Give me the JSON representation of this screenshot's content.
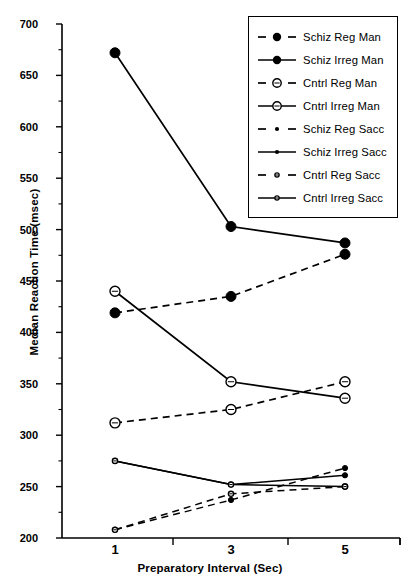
{
  "chart_data": {
    "type": "line",
    "title": "",
    "xlabel": "Preparatory Interval (Sec)",
    "ylabel": "Median Reaction Time (msec)",
    "x": [
      1,
      3,
      5
    ],
    "xticklabels": [
      "1",
      "3",
      "5"
    ],
    "yticks": [
      200,
      250,
      300,
      350,
      400,
      450,
      500,
      550,
      600,
      650,
      700
    ],
    "yticklabels": [
      "200",
      "250",
      "300",
      "350",
      "400",
      "450",
      "500",
      "550",
      "600",
      "650",
      "700"
    ],
    "ylim": [
      200,
      700
    ],
    "grid": false,
    "legend_position": "top-right",
    "series": [
      {
        "name": "Schiz Reg Man",
        "values": [
          419,
          435,
          476
        ],
        "line": "dashed",
        "marker": "filled-circle",
        "marker_size": "large"
      },
      {
        "name": "Schiz Irreg Man",
        "values": [
          672,
          503,
          487
        ],
        "line": "solid",
        "marker": "filled-circle",
        "marker_size": "large"
      },
      {
        "name": "Cntrl Reg Man",
        "values": [
          312,
          325,
          352
        ],
        "line": "dashed",
        "marker": "open-circle",
        "marker_size": "large"
      },
      {
        "name": "Cntrl Irreg Man",
        "values": [
          440,
          352,
          336
        ],
        "line": "solid",
        "marker": "open-circle",
        "marker_size": "large"
      },
      {
        "name": "Schiz Reg Sacc",
        "values": [
          208,
          237,
          268
        ],
        "line": "dashed",
        "marker": "filled-circle",
        "marker_size": "small"
      },
      {
        "name": "Schiz Irreg Sacc",
        "values": [
          275,
          252,
          261
        ],
        "line": "solid",
        "marker": "filled-circle",
        "marker_size": "small"
      },
      {
        "name": "Cntrl Reg Sacc",
        "values": [
          208,
          243,
          250
        ],
        "line": "dashed",
        "marker": "open-circle",
        "marker_size": "small"
      },
      {
        "name": "Cntrl Irreg Sacc",
        "values": [
          275,
          252,
          250
        ],
        "line": "solid",
        "marker": "open-circle",
        "marker_size": "small"
      }
    ]
  },
  "legend": {
    "items": [
      {
        "label": "Schiz Reg Man"
      },
      {
        "label": "Schiz Irreg Man"
      },
      {
        "label": "Cntrl Reg Man"
      },
      {
        "label": "Cntrl Irreg Man"
      },
      {
        "label": "Schiz Reg Sacc"
      },
      {
        "label": "Schiz Irreg Sacc"
      },
      {
        "label": "Cntrl Reg Sacc"
      },
      {
        "label": "Cntrl Irreg Sacc"
      }
    ]
  },
  "colors": {
    "ink": "#000000",
    "background": "#ffffff"
  }
}
